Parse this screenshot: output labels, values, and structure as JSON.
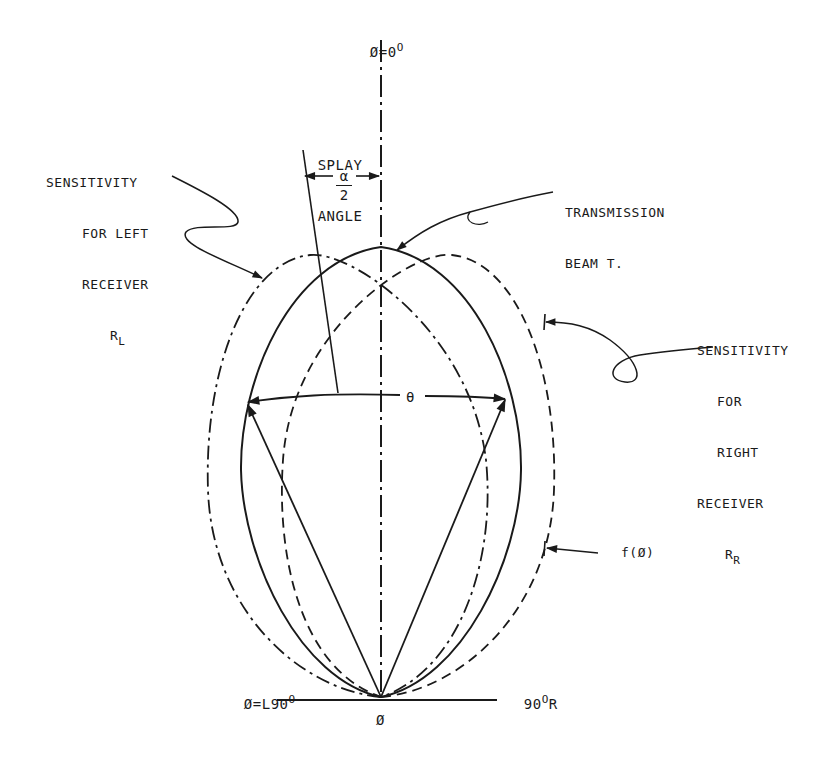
{
  "diagram": {
    "axis_top_label": {
      "symbol": "Ø",
      "eq": "=0",
      "sup": "O"
    },
    "axis_bottom_label": "Ø",
    "left_baseline_label": {
      "text": "Ø=L90",
      "sup": "O"
    },
    "right_baseline_label": {
      "text": "90",
      "sup": "O",
      "suffix": "R"
    },
    "splay_angle": {
      "line1": "SPLAY",
      "line2": "ANGLE",
      "numerator": "α",
      "denominator": "2"
    },
    "theta_label": "θ",
    "left_receiver": {
      "line1": "SENSITIVITY",
      "line2": "FOR LEFT",
      "line3": "RECEIVER",
      "symbol": "R",
      "sub": "L"
    },
    "right_receiver": {
      "line1": "SENSITIVITY",
      "line2": "FOR",
      "line3": "RIGHT",
      "line4": "RECEIVER",
      "symbol": "R",
      "sub": "R"
    },
    "transmission": {
      "line1": "TRANSMISSION",
      "line2": "BEAM T."
    },
    "function_label": "f(Ø)",
    "legend": [
      {
        "name": "Transmission beam T",
        "style": "solid"
      },
      {
        "name": "Left receiver sensitivity R_L",
        "style": "dash-dot"
      },
      {
        "name": "Right receiver sensitivity R_R",
        "style": "dashed"
      }
    ],
    "colors": {
      "ink": "#1a1a1a",
      "background": "#ffffff"
    }
  }
}
